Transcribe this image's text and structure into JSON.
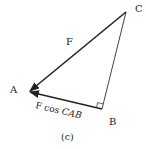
{
  "figure": {
    "caption": "(c)",
    "vertices": {
      "A": {
        "label": "A"
      },
      "B": {
        "label": "B"
      },
      "C": {
        "label": "C"
      }
    },
    "vectors": {
      "force": {
        "label": "F"
      },
      "component": {
        "label_main": "F cos ",
        "label_italic": "CAB"
      }
    },
    "colors": {
      "line": "#222222",
      "background": "#ffffff"
    }
  }
}
